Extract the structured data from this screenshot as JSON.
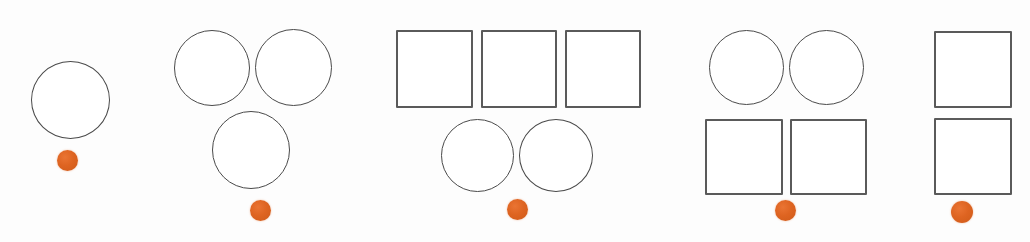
{
  "figure": {
    "background_color": "#fdfdfd",
    "outline_color": "#4a4a4a",
    "square_outline_color": "#5a5a5a",
    "marker_color": "#de6421",
    "fill_color": "#ffffff",
    "group_count": 5,
    "marker_count": 5
  },
  "groups": [
    {
      "id": "group-1",
      "label": "group-1",
      "shape_count": 1,
      "circle_count": 1,
      "square_count": 0,
      "left": 0,
      "shapes": [
        {
          "kind": "circle",
          "x": 31,
          "y": 61,
          "w": 79,
          "h": 78
        }
      ],
      "marker": {
        "x": 57,
        "y": 150,
        "size": 21
      }
    },
    {
      "id": "group-2",
      "label": "group-2",
      "shape_count": 3,
      "circle_count": 3,
      "square_count": 0,
      "left": 0,
      "shapes": [
        {
          "kind": "circle",
          "x": 174,
          "y": 30,
          "w": 76,
          "h": 76
        },
        {
          "kind": "circle",
          "x": 255,
          "y": 29,
          "w": 77,
          "h": 77
        },
        {
          "kind": "circle",
          "x": 212,
          "y": 111,
          "w": 78,
          "h": 78
        }
      ],
      "marker": {
        "x": 250,
        "y": 200,
        "size": 21
      }
    },
    {
      "id": "group-3",
      "label": "group-3",
      "shape_count": 5,
      "circle_count": 2,
      "square_count": 3,
      "left": 0,
      "shapes": [
        {
          "kind": "square",
          "x": 396,
          "y": 30,
          "w": 77,
          "h": 78
        },
        {
          "kind": "square",
          "x": 481,
          "y": 30,
          "w": 76,
          "h": 78
        },
        {
          "kind": "square",
          "x": 565,
          "y": 30,
          "w": 76,
          "h": 78
        },
        {
          "kind": "circle",
          "x": 441,
          "y": 119,
          "w": 73,
          "h": 73
        },
        {
          "kind": "circle",
          "x": 519,
          "y": 119,
          "w": 74,
          "h": 73
        }
      ],
      "marker": {
        "x": 507,
        "y": 199,
        "size": 21
      }
    },
    {
      "id": "group-4",
      "label": "group-4",
      "shape_count": 4,
      "circle_count": 2,
      "square_count": 2,
      "left": 0,
      "shapes": [
        {
          "kind": "circle",
          "x": 709,
          "y": 30,
          "w": 75,
          "h": 75
        },
        {
          "kind": "circle",
          "x": 789,
          "y": 30,
          "w": 75,
          "h": 75
        },
        {
          "kind": "square",
          "x": 705,
          "y": 119,
          "w": 78,
          "h": 76
        },
        {
          "kind": "square",
          "x": 790,
          "y": 119,
          "w": 77,
          "h": 76
        }
      ],
      "marker": {
        "x": 775,
        "y": 200,
        "size": 21
      }
    },
    {
      "id": "group-5",
      "label": "group-5",
      "shape_count": 2,
      "circle_count": 0,
      "square_count": 2,
      "left": 0,
      "shapes": [
        {
          "kind": "square",
          "x": 934,
          "y": 31,
          "w": 78,
          "h": 77
        },
        {
          "kind": "square",
          "x": 934,
          "y": 118,
          "w": 78,
          "h": 77
        }
      ],
      "marker": {
        "x": 951,
        "y": 201,
        "size": 22
      }
    }
  ]
}
